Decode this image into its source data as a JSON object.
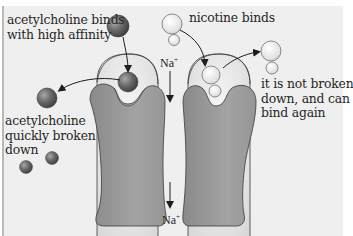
{
  "diagram": {
    "labels": {
      "ach_binds": "acetylcholine binds\nwith high affinity",
      "ach_broken": "acetylcholine\nquickly broken\ndown",
      "nicotine_binds": "nicotine binds",
      "nicotine_not_broken": "it is not broken\ndown, and can\nbind again"
    },
    "ions": {
      "top": {
        "symbol": "Na",
        "charge": "+"
      },
      "bottom": {
        "symbol": "Na",
        "charge": "+"
      }
    },
    "colors": {
      "background": "#efefef",
      "protein": "#8f8f8f",
      "protein_outline": "#3a3a3a",
      "binding_site": "#d9d9d9",
      "acetylcholine": "#5a5a5a",
      "nicotine": "#e6e6e6",
      "text": "#262626"
    }
  }
}
